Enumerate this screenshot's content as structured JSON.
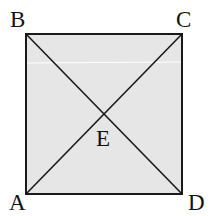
{
  "diagram": {
    "type": "square-with-diagonals",
    "fill_color": "#e6e6e6",
    "stroke_color": "#1a1a1a",
    "vertices": {
      "A": {
        "label": "A",
        "x": 26,
        "y": 194
      },
      "B": {
        "label": "B",
        "x": 26,
        "y": 34
      },
      "C": {
        "label": "C",
        "x": 182,
        "y": 34
      },
      "D": {
        "label": "D",
        "x": 182,
        "y": 194
      }
    },
    "intersection": {
      "label": "E",
      "x": 104,
      "y": 112
    },
    "segments": [
      "AB",
      "BC",
      "CD",
      "DA",
      "AC",
      "BD"
    ]
  }
}
